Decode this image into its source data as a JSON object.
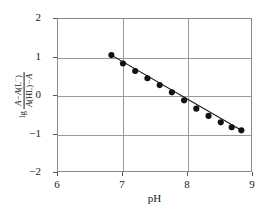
{
  "chart_data": {
    "type": "scatter",
    "title": "",
    "xlabel": "pH",
    "ylabel": "lg (A−A(L⁻))/(A(HL)−A)",
    "ylabel_parts": {
      "operator": "lg",
      "numerator_a": "A",
      "numerator_minus": "−",
      "numerator_b": "A",
      "numerator_species_open": "(L",
      "numerator_species_sup": "−",
      "numerator_species_close": ")",
      "denominator_a": "A",
      "denominator_species": "(HL)",
      "denominator_minus": "−",
      "denominator_b": "A"
    },
    "xlim": [
      6,
      9
    ],
    "ylim": [
      -2,
      2
    ],
    "xticks": [
      6,
      7,
      8,
      9
    ],
    "yticks": [
      2,
      1,
      0,
      -1,
      -2
    ],
    "xtick_labels": [
      "6",
      "7",
      "8",
      "9"
    ],
    "ytick_labels": [
      "2",
      "1",
      "0",
      "−1",
      "−2"
    ],
    "grid": true,
    "legend": "none",
    "marker": "filled-circle",
    "marker_color": "#111111",
    "line_color": "#111111",
    "frame_color": "#8a8a8a",
    "grid_color": "#9a9a9a",
    "background": "#ffffff",
    "x": [
      6.83,
      7.01,
      7.2,
      7.39,
      7.58,
      7.77,
      7.96,
      8.15,
      8.34,
      8.53,
      8.7,
      8.85
    ],
    "y": [
      1.05,
      0.83,
      0.63,
      0.44,
      0.26,
      0.07,
      -0.14,
      -0.36,
      -0.55,
      -0.72,
      -0.85,
      -0.93
    ],
    "trendline": {
      "x": [
        6.83,
        8.85
      ],
      "y": [
        1.05,
        -0.93
      ]
    }
  }
}
